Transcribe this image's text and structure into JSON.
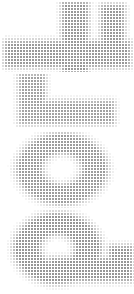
{
  "image": {
    "title": "Halftone Glyph Strip",
    "width": 134,
    "height": 294,
    "background_color": "#ffffff",
    "dot_color": "#6e6e6e",
    "render_style": "halftone-dot-matrix",
    "dot_pitch_px": 3,
    "dot_size_px": 2,
    "description": "Four large letterform glyphs stacked vertically, each rendered as a grid of small gray squares whose opacity varies to form the letter shape."
  },
  "panels": [
    {
      "name": "glyph-1",
      "label": "t",
      "caption": "cross / t-form",
      "x": 0,
      "y": 0,
      "width": 134,
      "height": 72,
      "origin_x": 2,
      "origin_y": 2,
      "cols": 44,
      "rows": 24,
      "peak_opacity": 0.72,
      "strokes": [
        {
          "shape": "rect",
          "col": 21,
          "row": 1,
          "cols": 7,
          "rows": 22
        },
        {
          "shape": "rect",
          "col": 2,
          "row": 14,
          "cols": 40,
          "rows": 7
        },
        {
          "shape": "rect",
          "col": 34,
          "row": 2,
          "cols": 6,
          "rows": 12
        }
      ]
    },
    {
      "name": "glyph-2",
      "label": "L",
      "caption": "corner / L-form",
      "x": 0,
      "y": 72,
      "width": 134,
      "height": 58,
      "origin_x": 10,
      "origin_y": 2,
      "cols": 40,
      "rows": 18,
      "peak_opacity": 0.66,
      "strokes": [
        {
          "shape": "rect",
          "col": 4,
          "row": 1,
          "cols": 7,
          "rows": 15
        },
        {
          "shape": "rect",
          "col": 4,
          "row": 10,
          "cols": 30,
          "rows": 6
        }
      ]
    },
    {
      "name": "glyph-3",
      "label": "O",
      "caption": "ring / O-form",
      "x": 0,
      "y": 130,
      "width": 134,
      "height": 78,
      "origin_x": 4,
      "origin_y": 2,
      "cols": 42,
      "rows": 26,
      "peak_opacity": 0.7,
      "strokes": [
        {
          "shape": "ring",
          "cx": 19.5,
          "cy": 12.5,
          "rx": 14.0,
          "ry": 11.0,
          "thickness": 5.0
        }
      ]
    },
    {
      "name": "glyph-4",
      "label": "a",
      "caption": "ring with tail / a-form",
      "x": 0,
      "y": 208,
      "width": 134,
      "height": 86,
      "origin_x": 4,
      "origin_y": 2,
      "cols": 44,
      "rows": 28,
      "peak_opacity": 0.74,
      "strokes": [
        {
          "shape": "ring",
          "cx": 18.0,
          "cy": 13.0,
          "rx": 13.5,
          "ry": 11.0,
          "thickness": 5.5
        },
        {
          "shape": "rect",
          "col": 16,
          "row": 17,
          "cols": 26,
          "rows": 6
        },
        {
          "shape": "rect",
          "col": 36,
          "row": 13,
          "cols": 6,
          "rows": 10
        }
      ]
    }
  ]
}
